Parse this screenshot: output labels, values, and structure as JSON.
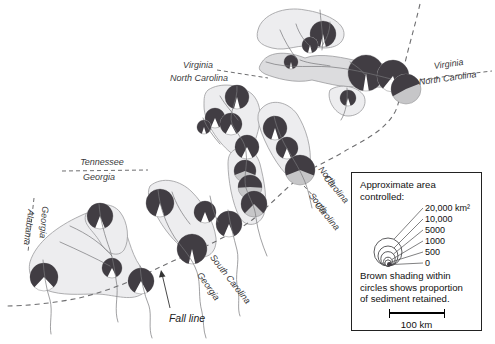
{
  "colors": {
    "pie_dark": "#413d43",
    "pie_gray": "#c6c6c8",
    "pie_white": "#ffffff",
    "watershed_fill": "#ededef",
    "watershed_fill_dark": "#dcdcde",
    "watershed_stroke": "#9b9b9d",
    "river": "#77777a",
    "dash": "#6e6e70",
    "label": "#3b3b3d"
  },
  "legend": {
    "title_lines": [
      "Approximate area",
      "controlled:"
    ],
    "sizes": [
      {
        "label": "20,000 km²",
        "r": 14
      },
      {
        "label": "10,000",
        "r": 10
      },
      {
        "label": "5000",
        "r": 7.2
      },
      {
        "label": "1000",
        "r": 4.4
      },
      {
        "label": "500",
        "r": 3
      },
      {
        "label": "0",
        "r": 1.2
      }
    ],
    "note_lines": [
      "Brown shading within",
      "circles shows proportion",
      "of sediment retained."
    ],
    "scale_label": "100 km"
  },
  "map": {
    "labels": [
      {
        "name": "virginia-left",
        "text": "Virginia",
        "x": 198,
        "y": 68,
        "rotate": 0
      },
      {
        "name": "north-carolina-left",
        "text": "North Carolina",
        "x": 199,
        "y": 81,
        "rotate": 0
      },
      {
        "name": "virginia-right",
        "text": "Virginia",
        "x": 449,
        "y": 67,
        "rotate": -8
      },
      {
        "name": "north-carolina-right",
        "text": "North Carolina",
        "x": 448,
        "y": 81,
        "rotate": -8
      },
      {
        "name": "tennessee",
        "text": "Tennessee",
        "x": 102,
        "y": 165,
        "rotate": 0
      },
      {
        "name": "georgia-tennessee",
        "text": "Georgia",
        "x": 99,
        "y": 180,
        "rotate": 0
      },
      {
        "name": "georgia-vertical",
        "text": "Georgia",
        "x": 41,
        "y": 222,
        "rotate": 95
      },
      {
        "name": "alabama-vertical",
        "text": "Alabama",
        "x": 26,
        "y": 227,
        "rotate": 97
      },
      {
        "name": "north-of-nc",
        "text": "North",
        "x": 325,
        "y": 178,
        "rotate": 50
      },
      {
        "name": "carolina-of-nc",
        "text": "Carolina",
        "x": 334,
        "y": 191,
        "rotate": 50
      },
      {
        "name": "south-of-sc",
        "text": "South",
        "x": 316,
        "y": 205,
        "rotate": 50
      },
      {
        "name": "carolina-of-sc",
        "text": "Carolina",
        "x": 325,
        "y": 218,
        "rotate": 50
      },
      {
        "name": "south-carolina-diagonal",
        "text": "South Carolina",
        "x": 228,
        "y": 281,
        "rotate": 52
      },
      {
        "name": "georgia-diagonal",
        "text": "Georgia",
        "x": 206,
        "y": 288,
        "rotate": 55
      }
    ],
    "fall_line_label": {
      "text": "Fall line",
      "x": 187,
      "y": 322
    },
    "boundary_dashes": [
      {
        "x1": 217,
        "y1": 70,
        "x2": 268,
        "y2": 78
      },
      {
        "x1": 400,
        "y1": 82,
        "x2": 492,
        "y2": 71
      },
      {
        "x1": 62,
        "y1": 171,
        "x2": 148,
        "y2": 170
      },
      {
        "x1": 34,
        "y1": 198,
        "x2": 28,
        "y2": 252
      },
      {
        "x1": 304,
        "y1": 186,
        "x2": 317,
        "y2": 200
      }
    ],
    "fall_line_path": "M420,4 C414,30 407,52 403,72 C400,88 401,100 395,112 C384,132 362,141 345,151 C327,162 312,167 300,177 C285,189 266,209 252,220 C240,229 221,239 204,247 C187,255 170,262 150,272 C128,283 104,292 79,298 C55,303 26,306 6,306",
    "watersheds": [
      {
        "d": "M258,30 C262,14 285,6 305,10 C325,13 345,22 344,35 C343,46 330,50 315,47 C298,43 288,52 272,48 C260,45 255,40 258,30 Z"
      },
      {
        "d": "M262,62 C270,50 290,52 305,58 C320,52 345,58 362,62 C378,60 392,66 394,76 C395,86 382,90 368,85 C350,90 330,84 312,80 C295,84 275,78 265,74 C258,70 258,68 262,62 Z",
        "dark": true
      },
      {
        "d": "M330,90 C340,83 358,86 364,96 C368,106 360,116 348,116 C336,116 326,100 330,90 Z"
      },
      {
        "d": "M208,90 C220,82 240,84 252,94 C262,104 262,120 256,138 C250,154 240,160 230,152 C218,142 204,122 204,106 C204,98 204,94 208,90 Z"
      },
      {
        "d": "M262,108 C272,98 288,102 297,114 C306,128 312,148 310,166 C308,180 296,184 286,174 C274,162 260,134 258,120 C258,114 258,112 262,108 Z"
      },
      {
        "d": "M234,150 C244,144 256,150 260,164 C264,180 268,200 264,214 C260,226 246,228 240,218 C232,204 228,178 228,164 C228,156 230,153 234,150 Z"
      },
      {
        "d": "M150,186 C162,176 180,180 192,192 C204,204 214,222 216,238 C217,252 208,260 196,256 C184,252 168,236 158,218 C150,204 146,194 150,186 Z"
      },
      {
        "d": "M30,262 C36,242 58,226 80,216 C96,208 112,208 120,220 C128,232 130,252 140,266 C148,276 150,288 142,294 C130,302 112,294 96,294 C80,294 62,296 46,290 C34,286 27,274 30,262 Z"
      },
      {
        "d": "M86,214 C96,202 112,202 120,212 C128,222 130,240 124,250 C118,258 106,254 100,242 C93,230 82,224 86,214 Z"
      }
    ],
    "rivers": [
      "M320,10 C321,25 324,38 322,50",
      "M296,24 C299,34 305,42 311,47",
      "M280,30 C284,40 290,50 296,58",
      "M330,22 C330,32 326,40 322,46",
      "M266,62 C290,70 315,64 340,68 C355,70 372,74 391,79",
      "M300,60 C310,64 320,64 330,66",
      "M350,62 C356,66 362,70 366,76",
      "M347,88 C348,100 346,112 341,120",
      "M237,86 C238,102 228,112 232,124 C238,136 245,140 246,152 C248,166 243,176 246,188 C250,200 255,206 256,218 C258,232 262,244 267,256",
      "M220,96 C226,106 232,112 238,120",
      "M203,118 C207,128 213,136 220,144",
      "M274,116 C277,130 283,142 289,152 C295,162 300,170 305,182 C309,192 310,200 312,208",
      "M158,190 C160,208 166,224 175,238 C184,250 192,258 197,272 C201,284 198,298 202,312 C204,322 203,330 206,338",
      "M172,192 C176,204 182,214 190,224",
      "M210,196 C212,206 214,214 218,222",
      "M228,210 C230,224 234,238 237,250 C240,262 234,276 238,290 C240,300 237,308 240,316",
      "M99,204 C100,220 105,236 110,250 C114,262 115,274 117,286 C118,298 114,310 118,322",
      "M43,260 C44,274 46,288 50,300 C53,312 49,324 51,334",
      "M140,266 C141,280 144,294 149,306 C152,316 148,328 152,338",
      "M60,242 C78,250 95,258 110,266",
      "M70,226 C88,234 102,244 112,256"
    ],
    "pies": [
      {
        "x": 323,
        "y": 34,
        "r": 13,
        "retained": 0.93,
        "light": "white"
      },
      {
        "x": 310,
        "y": 45,
        "r": 8,
        "retained": 0.92,
        "light": "white"
      },
      {
        "x": 291,
        "y": 62,
        "r": 7,
        "retained": 0.93,
        "light": "white"
      },
      {
        "x": 366,
        "y": 73,
        "r": 18,
        "retained": 0.95,
        "light": "white"
      },
      {
        "x": 393,
        "y": 76,
        "r": 16,
        "retained": 0.84,
        "light": "white",
        "a": 100
      },
      {
        "x": 406,
        "y": 89,
        "r": 15,
        "retained": 0.52,
        "light": "gray",
        "a": 65
      },
      {
        "x": 348,
        "y": 98,
        "r": 8,
        "retained": 0.9,
        "light": "white"
      },
      {
        "x": 237,
        "y": 97,
        "r": 12,
        "retained": 0.92,
        "light": "white"
      },
      {
        "x": 215,
        "y": 118,
        "r": 10,
        "retained": 0.87,
        "light": "white"
      },
      {
        "x": 231,
        "y": 124,
        "r": 11,
        "retained": 0.84,
        "light": "white"
      },
      {
        "x": 204,
        "y": 127,
        "r": 7,
        "retained": 0.9,
        "light": "white"
      },
      {
        "x": 247,
        "y": 147,
        "r": 12,
        "retained": 0.85,
        "light": "white"
      },
      {
        "x": 275,
        "y": 128,
        "r": 12,
        "retained": 0.9,
        "light": "white"
      },
      {
        "x": 287,
        "y": 148,
        "r": 11,
        "retained": 0.88,
        "light": "white"
      },
      {
        "x": 300,
        "y": 170,
        "r": 15,
        "retained": 0.62,
        "light": "gray"
      },
      {
        "x": 245,
        "y": 171,
        "r": 11,
        "retained": 0.62,
        "light": "gray"
      },
      {
        "x": 250,
        "y": 187,
        "r": 12,
        "retained": 0.52,
        "light": "gray"
      },
      {
        "x": 254,
        "y": 204,
        "r": 13,
        "retained": 0.75,
        "light": "gray"
      },
      {
        "x": 205,
        "y": 212,
        "r": 11,
        "retained": 0.88,
        "light": "white"
      },
      {
        "x": 229,
        "y": 224,
        "r": 13,
        "retained": 0.87,
        "light": "white"
      },
      {
        "x": 192,
        "y": 249,
        "r": 15,
        "retained": 0.93,
        "light": "white"
      },
      {
        "x": 160,
        "y": 203,
        "r": 14,
        "retained": 0.9,
        "light": "white"
      },
      {
        "x": 100,
        "y": 216,
        "r": 13,
        "retained": 0.88,
        "light": "white"
      },
      {
        "x": 112,
        "y": 268,
        "r": 10,
        "retained": 0.85,
        "light": "white"
      },
      {
        "x": 141,
        "y": 281,
        "r": 13,
        "retained": 0.84,
        "light": "white"
      },
      {
        "x": 44,
        "y": 277,
        "r": 14,
        "retained": 0.76,
        "light": "white"
      }
    ]
  }
}
